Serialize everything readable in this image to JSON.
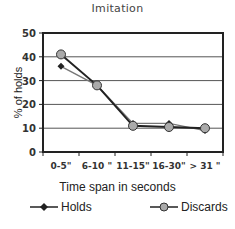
{
  "chart_data": {
    "type": "line",
    "title": "Imitation",
    "xlabel": "Time span in seconds",
    "ylabel": "% of holds",
    "categories": [
      "0-5\"",
      "6-10 \"",
      "11-15\"",
      "16-30\"",
      "> 31 \""
    ],
    "ylim": [
      0,
      50
    ],
    "yticks": [
      0,
      10,
      20,
      30,
      40,
      50
    ],
    "grid": true,
    "legend_position": "bottom",
    "series": [
      {
        "name": "Holds",
        "marker": "diamond",
        "color": "#222222",
        "values": [
          36,
          28,
          12,
          12,
          9
        ]
      },
      {
        "name": "Discards",
        "marker": "circle",
        "color": "#555555",
        "values": [
          41,
          28,
          11,
          10.5,
          10
        ]
      }
    ]
  },
  "labels": {
    "title": "Imitation",
    "ylabel": "% of holds",
    "xlabel": "Time span in seconds",
    "legend_holds": "Holds",
    "legend_discards": "Discards"
  }
}
